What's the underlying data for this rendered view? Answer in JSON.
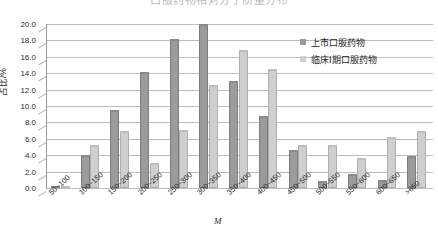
{
  "title": {
    "text": "口服药物相对分子质量分布"
  },
  "legend": {
    "position": "top-right",
    "entries": [
      {
        "label": "上市口服药物",
        "swatch": "dark",
        "color": "#9b9b9b"
      },
      {
        "label": "临床Ⅰ期口服药物",
        "swatch": "light",
        "color": "#cfcfcf"
      }
    ]
  },
  "axes": {
    "ylabel": "占比/%",
    "xlabel": "M",
    "yticks": [
      "0.0",
      "2.0",
      "4.0",
      "6.0",
      "8.0",
      "10.0",
      "12.0",
      "14.0",
      "16.0",
      "18.0",
      "20.0"
    ],
    "ylim": [
      0,
      20
    ],
    "grid": true
  },
  "chart_data": {
    "type": "bar",
    "title": "口服药物相对分子质量分布",
    "xlabel": "M",
    "ylabel": "占比/%",
    "ylim": [
      0,
      20
    ],
    "grid": true,
    "legend_position": "top-right",
    "categories": [
      "50~100",
      "100~150",
      "150~200",
      "200~250",
      "250~300",
      "300~350",
      "350~400",
      "400~450",
      "450~500",
      "500~550",
      "550~600",
      "600~650",
      ">650"
    ],
    "series": [
      {
        "name": "上市口服药物",
        "color": "#9b9b9b",
        "values": [
          0.3,
          4.0,
          9.5,
          14.2,
          18.2,
          20.0,
          13.0,
          8.8,
          4.6,
          0.8,
          1.7,
          1.0,
          3.9
        ]
      },
      {
        "name": "临床Ⅰ期口服药物",
        "color": "#cfcfcf",
        "values": [
          0.2,
          5.3,
          7.0,
          3.1,
          7.1,
          12.6,
          16.8,
          14.5,
          5.2,
          5.2,
          3.6,
          6.2,
          6.9
        ]
      }
    ]
  }
}
